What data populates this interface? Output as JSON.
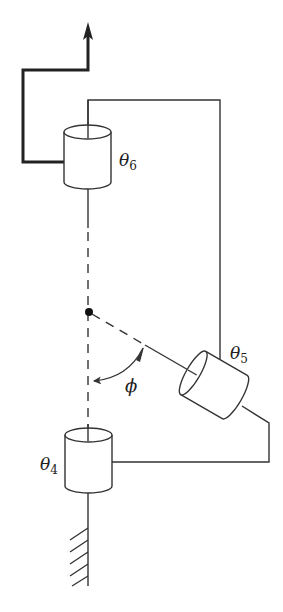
{
  "diagram": {
    "type": "robot-wrist-kinematics",
    "colors": {
      "line": "#333333",
      "background": "#ffffff"
    },
    "joints": [
      {
        "id": "joint-6",
        "symbol": "θ",
        "subscript": "6"
      },
      {
        "id": "joint-5",
        "symbol": "θ",
        "subscript": "5"
      },
      {
        "id": "joint-4",
        "symbol": "θ",
        "subscript": "4"
      }
    ],
    "angle_label": "ϕ"
  }
}
